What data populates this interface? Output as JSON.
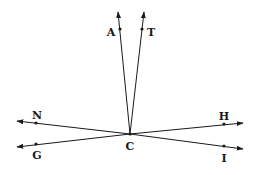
{
  "diagram": {
    "vertex": {
      "label": "C",
      "x": 130,
      "y": 134,
      "label_x": 130,
      "label_y": 149
    },
    "rays": [
      {
        "name": "ray-CA",
        "point_label": "A",
        "tip": [
          118,
          12
        ],
        "point": [
          120,
          29
        ],
        "label_pos": [
          111,
          33
        ]
      },
      {
        "name": "ray-CT",
        "point_label": "T",
        "tip": [
          144,
          12
        ],
        "point": [
          142,
          29
        ],
        "label_pos": [
          151,
          33
        ]
      },
      {
        "name": "ray-CN",
        "point_label": "N",
        "tip": [
          17,
          121
        ],
        "point": [
          36,
          123
        ],
        "label_pos": [
          37,
          117
        ]
      },
      {
        "name": "ray-CG",
        "point_label": "G",
        "tip": [
          17,
          147
        ],
        "point": [
          36,
          144
        ],
        "label_pos": [
          37,
          158
        ]
      },
      {
        "name": "ray-CH",
        "point_label": "H",
        "tip": [
          243,
          123
        ],
        "point": [
          224,
          124
        ],
        "label_pos": [
          224,
          117
        ]
      },
      {
        "name": "ray-CI",
        "point_label": "I",
        "tip": [
          243,
          149
        ],
        "point": [
          224,
          146
        ],
        "label_pos": [
          224,
          160
        ]
      }
    ],
    "labels": {
      "A": "A",
      "T": "T",
      "N": "N",
      "G": "G",
      "H": "H",
      "I": "I",
      "C": "C"
    },
    "stroke_color": "#1a1a1a"
  }
}
